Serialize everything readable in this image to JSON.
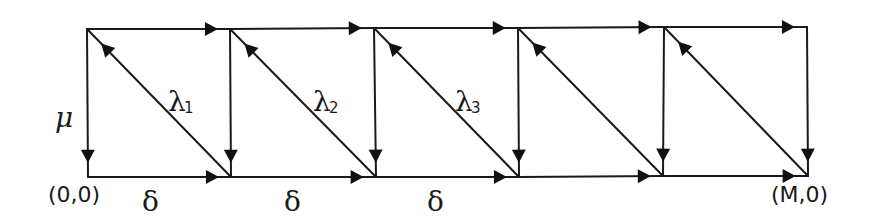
{
  "diagram": {
    "colors": {
      "stroke": "#1a1a1a",
      "background": "#ffffff"
    },
    "top_nodes": [
      [
        87,
        29
      ],
      [
        230,
        29
      ],
      [
        374,
        28
      ],
      [
        518,
        28
      ],
      [
        664,
        27
      ],
      [
        807,
        27
      ]
    ],
    "bottom_nodes": [
      [
        88,
        177
      ],
      [
        231,
        177
      ],
      [
        376,
        177
      ],
      [
        519,
        177
      ],
      [
        663,
        176
      ],
      [
        808,
        176
      ]
    ],
    "edges": {
      "top_rate": "",
      "bottom_rate": "δ",
      "vertical_rate": "μ",
      "diagonal_rates": [
        "λ",
        "λ",
        "λ",
        "",
        ""
      ]
    },
    "labels": {
      "origin": "(0,0)",
      "end": "(M,0)",
      "mu": "μ",
      "delta": [
        "δ",
        "δ",
        "δ"
      ],
      "lambda": [
        {
          "symbol": "λ",
          "sub": "1"
        },
        {
          "symbol": "λ",
          "sub": "2"
        },
        {
          "symbol": "λ",
          "sub": "3"
        }
      ]
    }
  }
}
